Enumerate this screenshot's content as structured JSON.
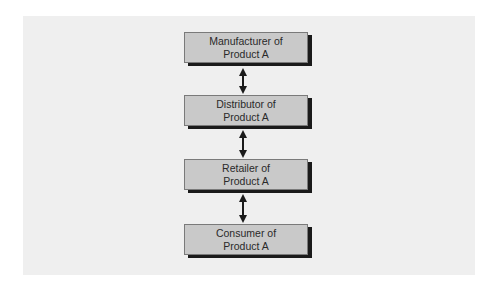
{
  "diagram": {
    "type": "vertical-flowchart",
    "nodes": [
      {
        "id": "manufacturer",
        "line1": "Manufacturer of",
        "line2": "Product A"
      },
      {
        "id": "distributor",
        "line1": "Distributor of",
        "line2": "Product A"
      },
      {
        "id": "retailer",
        "line1": "Retailer of",
        "line2": "Product A"
      },
      {
        "id": "consumer",
        "line1": "Consumer of",
        "line2": "Product A"
      }
    ],
    "edges": [
      {
        "from": "manufacturer",
        "to": "distributor",
        "direction": "bidirectional"
      },
      {
        "from": "distributor",
        "to": "retailer",
        "direction": "bidirectional"
      },
      {
        "from": "retailer",
        "to": "consumer",
        "direction": "bidirectional"
      }
    ],
    "colors": {
      "panel_background": "#efefef",
      "node_fill": "#c9c9c9",
      "node_border": "#7a7a7a",
      "node_shadow": "#1a1a1a",
      "arrow": "#1a1a1a",
      "text": "#2a2a2a"
    }
  }
}
